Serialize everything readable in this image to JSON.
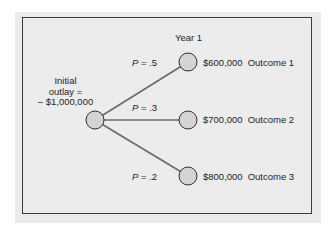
{
  "diagram": {
    "type": "decision-tree",
    "period_label": "Year 1",
    "root": {
      "label_lines": [
        "Initial",
        "outlay =",
        "– $1,000,000"
      ]
    },
    "branches": [
      {
        "prob_symbol": "P",
        "prob_eq": " = ",
        "prob_value": ".5",
        "amount": "$600,000",
        "outcome": "Outcome 1"
      },
      {
        "prob_symbol": "P",
        "prob_eq": " = ",
        "prob_value": ".3",
        "amount": "$700,000",
        "outcome": "Outcome 2"
      },
      {
        "prob_symbol": "P",
        "prob_eq": " = ",
        "prob_value": ".2",
        "amount": "$800,000",
        "outcome": "Outcome 3"
      }
    ],
    "colors": {
      "panel_background": "#ebebeb",
      "frame_border": "#3a3a3a",
      "node_fill": "#d4d4d4",
      "node_stroke": "#2e2e2e",
      "branch_line": "#6a6a6a"
    }
  }
}
